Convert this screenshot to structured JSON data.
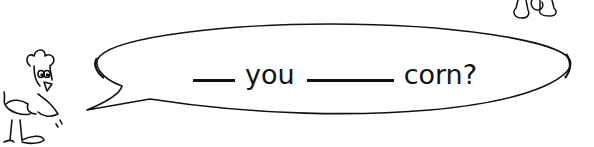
{
  "worksheet": {
    "prompt_parts": [
      {
        "type": "blank",
        "length": "short"
      },
      {
        "type": "word",
        "text": "you"
      },
      {
        "type": "blank",
        "length": "long"
      },
      {
        "type": "word",
        "text": "corn?"
      }
    ],
    "word_1": "you",
    "word_2": "corn?"
  },
  "illustrations": {
    "speaker": "chicken-cartoon",
    "partial_figure_top_right": "animal-feet-cartoon"
  },
  "colors": {
    "ink": "#111111",
    "background": "#ffffff"
  }
}
